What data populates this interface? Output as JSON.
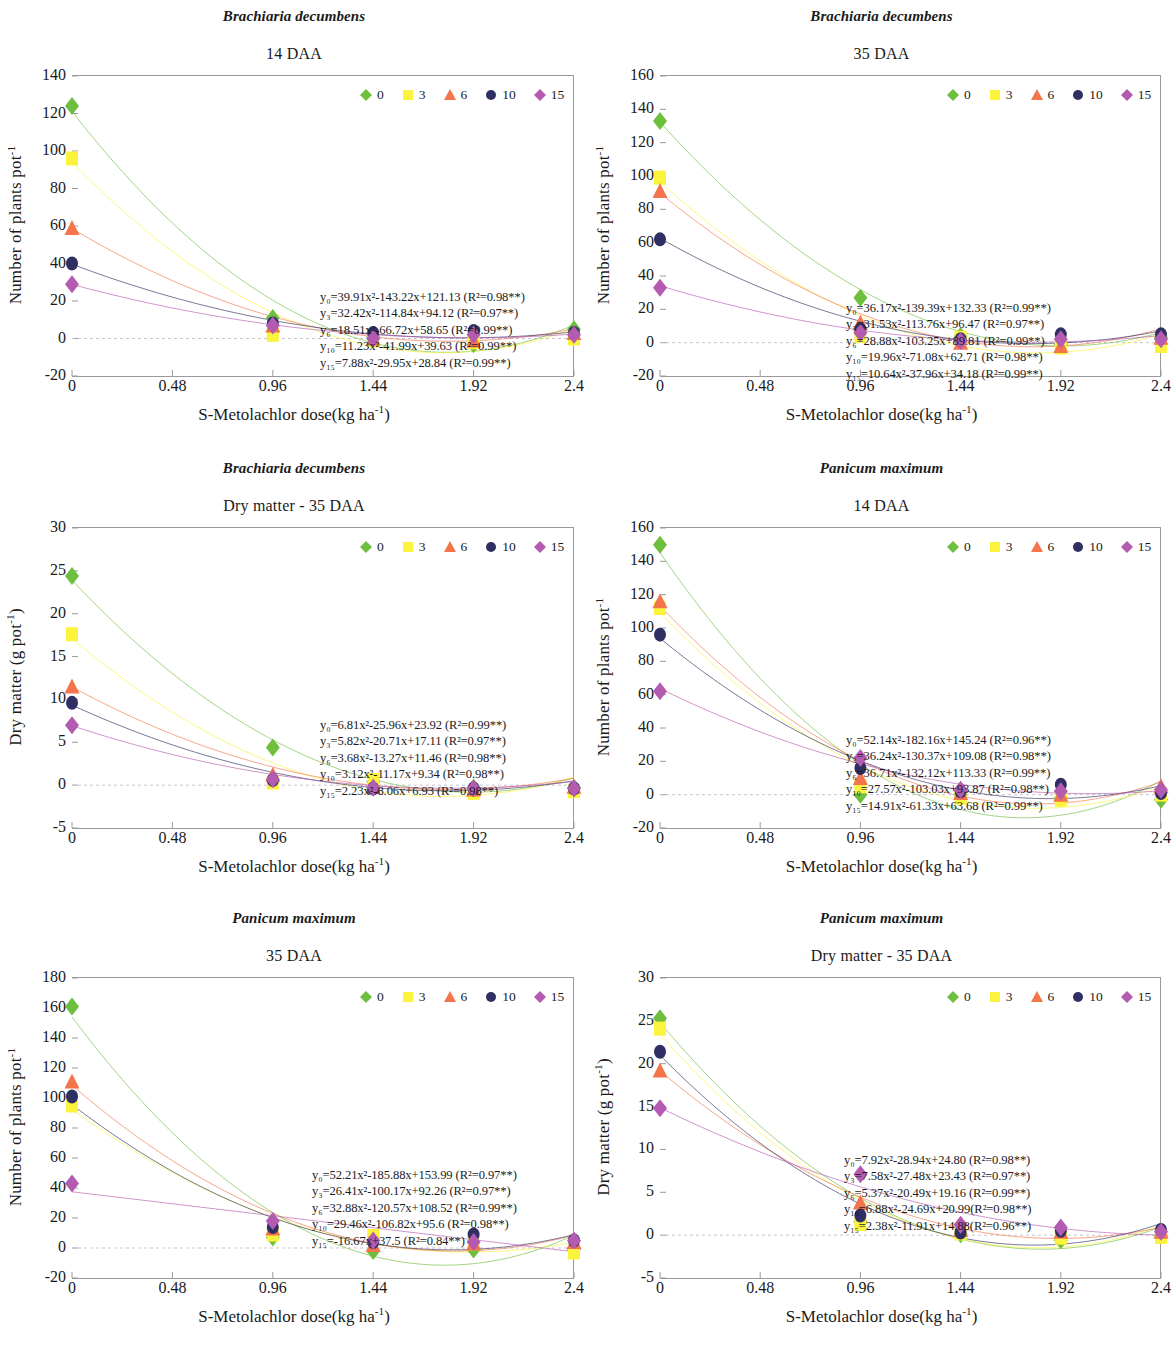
{
  "axis": {
    "xlabel_main": "S-Metolachlor dose(kg ha",
    "xlabel_sup": "-1",
    "xlabel_close": ")",
    "ylabel_plants_main": "Number of plants pot",
    "ylabel_plants_sup": "-1",
    "ylabel_dm_main": "Dry matter (g pot",
    "ylabel_dm_sup": "-1",
    "ylabel_dm_close": ")",
    "xticks": [
      "0",
      "0.48",
      "0.96",
      "1.44",
      "1.92",
      "2.4"
    ]
  },
  "legend": {
    "items": [
      {
        "label": "0",
        "marker": "diamond",
        "color": "#6fbf3f",
        "name": "legend-marker-0"
      },
      {
        "label": "3",
        "marker": "square",
        "color": "#fbf33c",
        "name": "legend-marker-3"
      },
      {
        "label": "6",
        "marker": "triangle",
        "color": "#f4744b",
        "name": "legend-marker-6"
      },
      {
        "label": "10",
        "marker": "circle",
        "color": "#2f2f63",
        "name": "legend-marker-10"
      },
      {
        "label": "15",
        "marker": "diamond",
        "color": "#b35bb0",
        "name": "legend-marker-15"
      }
    ]
  },
  "charts": [
    {
      "id": "bd-14daa",
      "species": "Brachiaria decumbens",
      "subtitle": "14 DAA",
      "equations": [
        "y₀=39.91x²-143.22x+121.13 (R²=0.98**)",
        "y₃=32.42x²-114.84x+94.12 (R²=0.97**)",
        "y₆=18.51x²-66.72x+58.65 (R²=0.99**)",
        "y₁₀=11.23x²-41.99x+39.63 (R²=0.99**)",
        "y₁₅=7.88x²-29.95x+28.84 (R²=0.99**)"
      ],
      "chart_data": {
        "type": "scatter",
        "title": "Brachiaria decumbens — 14 DAA",
        "xlabel": "S-Metolachlor dose(kg ha-1)",
        "ylabel": "Number of plants pot-1",
        "xlim": [
          0,
          2.4
        ],
        "ylim": [
          -20,
          140
        ],
        "yticks": [
          -20,
          0,
          20,
          40,
          60,
          80,
          100,
          120,
          140
        ],
        "x": [
          0,
          0.96,
          1.44,
          1.92,
          2.4
        ],
        "series": [
          {
            "name": "0",
            "coef": [
              39.91,
              -143.22,
              121.13
            ],
            "r2": "0.98**",
            "values": [
              124,
              11,
              1,
              -3,
              5
            ]
          },
          {
            "name": "3",
            "coef": [
              32.42,
              -114.84,
              94.12
            ],
            "r2": "0.97**",
            "values": [
              96,
              2,
              -1,
              -2,
              0
            ]
          },
          {
            "name": "6",
            "coef": [
              18.51,
              -66.72,
              58.65
            ],
            "r2": "0.99**",
            "values": [
              59,
              7,
              0,
              -1,
              3
            ]
          },
          {
            "name": "10",
            "coef": [
              11.23,
              -41.99,
              39.63
            ],
            "r2": "0.99**",
            "values": [
              40,
              8,
              3,
              4,
              3
            ]
          },
          {
            "name": "15",
            "coef": [
              7.88,
              -29.95,
              28.84
            ],
            "r2": "0.99**",
            "values": [
              29,
              7,
              0,
              2,
              2
            ]
          }
        ]
      }
    },
    {
      "id": "bd-35daa",
      "species": "Brachiaria decumbens",
      "subtitle": "35 DAA",
      "equations": [
        "y₀=36.17x²-139.39x+132.33 (R²=0.99**)",
        "y₃=31.53x²-113.76x+96.47 (R²=0.97**)",
        "y₆=28.88x²-103.25x+89.81 (R²=0.99**)",
        "y₁₀=19.96x²-71.08x+62.71 (R²=0.98**)",
        "y₁₅=10.64x²-37.96x+34.18 (R²=0.99**)"
      ],
      "chart_data": {
        "type": "scatter",
        "title": "Brachiaria decumbens — 35 DAA",
        "xlabel": "S-Metolachlor dose(kg ha-1)",
        "ylabel": "Number of plants pot-1",
        "xlim": [
          0,
          2.4
        ],
        "ylim": [
          -20,
          160
        ],
        "yticks": [
          -20,
          0,
          20,
          40,
          60,
          80,
          100,
          120,
          140,
          160
        ],
        "x": [
          0,
          0.96,
          1.44,
          1.92,
          2.4
        ],
        "series": [
          {
            "name": "0",
            "coef": [
              36.17,
              -139.39,
              132.33
            ],
            "r2": "0.99**",
            "values": [
              133,
              27,
              4,
              -1,
              3
            ]
          },
          {
            "name": "3",
            "coef": [
              31.53,
              -113.76,
              96.47
            ],
            "r2": "0.97**",
            "values": [
              99,
              4,
              3,
              -3,
              -2
            ]
          },
          {
            "name": "6",
            "coef": [
              28.88,
              -103.25,
              89.81
            ],
            "r2": "0.99**",
            "values": [
              91,
              12,
              0,
              -2,
              3
            ]
          },
          {
            "name": "10",
            "coef": [
              19.96,
              -71.08,
              62.71
            ],
            "r2": "0.98**",
            "values": [
              62,
              8,
              2,
              5,
              5
            ]
          },
          {
            "name": "15",
            "coef": [
              10.64,
              -37.96,
              34.18
            ],
            "r2": "0.99**",
            "values": [
              33,
              6,
              1,
              2,
              2
            ]
          }
        ]
      }
    },
    {
      "id": "bd-dm-35daa",
      "species": "Brachiaria decumbens",
      "subtitle": "Dry matter - 35 DAA",
      "equations": [
        "y₀=6.81x²-25.96x+23.92 (R²=0.99**)",
        "y₃=5.82x²-20.71x+17.11 (R²=0.97**)",
        "y₆=3.68x²-13.27x+11.46 (R²=0.98**)",
        "y₁₀=3.12x²-11.17x+9.34 (R²=0.98**)",
        "y₁₅=2.23x²-8.06x+6.93 (R²=0.98**)"
      ],
      "chart_data": {
        "type": "scatter",
        "title": "Brachiaria decumbens — Dry matter - 35 DAA",
        "xlabel": "S-Metolachlor dose(kg ha-1)",
        "ylabel": "Dry matter (g pot-1)",
        "xlim": [
          0,
          2.4
        ],
        "ylim": [
          -5,
          30
        ],
        "yticks": [
          -5,
          0,
          5,
          10,
          15,
          20,
          25,
          30
        ],
        "x": [
          0,
          0.96,
          1.44,
          1.92,
          2.4
        ],
        "series": [
          {
            "name": "0",
            "coef": [
              6.81,
              -25.96,
              23.92
            ],
            "r2": "0.99**",
            "values": [
              24.4,
              4.4,
              0.4,
              -0.3,
              -0.3
            ]
          },
          {
            "name": "3",
            "coef": [
              5.82,
              -20.71,
              17.11
            ],
            "r2": "0.97**",
            "values": [
              17.6,
              0.3,
              0.6,
              -0.9,
              -0.7
            ]
          },
          {
            "name": "6",
            "coef": [
              3.68,
              -13.27,
              11.46
            ],
            "r2": "0.98**",
            "values": [
              11.5,
              1.2,
              -0.2,
              -0.5,
              -0.2
            ]
          },
          {
            "name": "10",
            "coef": [
              3.12,
              -11.17,
              9.34
            ],
            "r2": "0.98**",
            "values": [
              9.6,
              0.6,
              -0.4,
              -0.4,
              -0.4
            ]
          },
          {
            "name": "15",
            "coef": [
              2.23,
              -8.06,
              6.93
            ],
            "r2": "0.98**",
            "values": [
              7.0,
              0.7,
              -0.3,
              -0.4,
              -0.4
            ]
          }
        ]
      }
    },
    {
      "id": "pm-14daa",
      "species": "Panicum maximum",
      "subtitle": "14 DAA",
      "equations": [
        "y₀=52.14x²-182.16x+145.24 (R²=0.96**)",
        "y₃=36.24x²-130.37x+109.08 (R²=0.98**)",
        "y₆=36.71x²-132.12x+113.33 (R²=0.99**)",
        "y₁₀=27.57x²-103.03x+93.87 (R²=0.98**)",
        "y₁₅=14.91x²-61.33x+63.68 (R²=0.99**)"
      ],
      "chart_data": {
        "type": "scatter",
        "title": "Panicum maximum — 14 DAA",
        "xlabel": "S-Metolachlor dose(kg ha-1)",
        "ylabel": "Number of plants pot-1",
        "xlim": [
          0,
          2.4
        ],
        "ylim": [
          -20,
          160
        ],
        "yticks": [
          -20,
          0,
          20,
          40,
          60,
          80,
          100,
          120,
          140,
          160
        ],
        "x": [
          0,
          0.96,
          1.44,
          1.92,
          2.4
        ],
        "series": [
          {
            "name": "0",
            "coef": [
              52.14,
              -182.16,
              145.24
            ],
            "r2": "0.96**",
            "values": [
              150,
              0,
              0,
              -2,
              -3
            ]
          },
          {
            "name": "3",
            "coef": [
              36.24,
              -130.37,
              109.08
            ],
            "r2": "0.98**",
            "values": [
              112,
              5,
              -2,
              -3,
              0
            ]
          },
          {
            "name": "6",
            "coef": [
              36.71,
              -132.12,
              113.33
            ],
            "r2": "0.99**",
            "values": [
              116,
              10,
              1,
              0,
              5
            ]
          },
          {
            "name": "10",
            "coef": [
              27.57,
              -103.03,
              93.87
            ],
            "r2": "0.98**",
            "values": [
              96,
              16,
              2,
              6,
              1
            ]
          },
          {
            "name": "15",
            "coef": [
              14.91,
              -61.33,
              63.68
            ],
            "r2": "0.99**",
            "values": [
              62,
              22,
              3,
              2,
              3
            ]
          }
        ]
      }
    },
    {
      "id": "pm-35daa",
      "species": "Panicum maximum",
      "subtitle": "35 DAA",
      "equations": [
        "y₀=52.21x²-185.88x+153.99 (R²=0.97**)",
        "y₃=26.41x²-100.17x+92.26 (R²=0.97**)",
        "y₆=32.88x²-120.57x+108.52 (R²=0.99**)",
        "y₁₀=29.46x²-106.82x+95.6 (R²=0.98**)",
        "y₁₅=-16.67x+37.5 (R²=0.84**)"
      ],
      "chart_data": {
        "type": "scatter",
        "title": "Panicum maximum — 35 DAA",
        "xlabel": "S-Metolachlor dose(kg ha-1)",
        "ylabel": "Number of plants pot-1",
        "xlim": [
          0,
          2.4
        ],
        "ylim": [
          -20,
          180
        ],
        "yticks": [
          -20,
          0,
          20,
          40,
          60,
          80,
          100,
          120,
          140,
          160,
          180
        ],
        "x": [
          0,
          0.96,
          1.44,
          1.92,
          2.4
        ],
        "series": [
          {
            "name": "0",
            "coef": [
              52.21,
              -185.88,
              153.99
            ],
            "r2": "0.97**",
            "values": [
              161,
              7,
              -2,
              -1,
              -1
            ]
          },
          {
            "name": "3",
            "coef": [
              26.41,
              -100.17,
              92.26
            ],
            "r2": "0.97**",
            "values": [
              95,
              9,
              8,
              3,
              -3
            ]
          },
          {
            "name": "6",
            "coef": [
              32.88,
              -120.57,
              108.52
            ],
            "r2": "0.99**",
            "values": [
              111,
              13,
              2,
              3,
              4
            ]
          },
          {
            "name": "10",
            "coef": [
              29.46,
              -106.82,
              95.6
            ],
            "r2": "0.98**",
            "values": [
              101,
              14,
              4,
              9,
              5
            ]
          },
          {
            "name": "15",
            "coef": [
              -16.67,
              37.5
            ],
            "r2": "0.84**",
            "values": [
              43,
              18,
              5,
              4,
              5
            ]
          }
        ]
      }
    },
    {
      "id": "pm-dm-35daa",
      "species": "Panicum maximum",
      "subtitle": "Dry matter - 35 DAA",
      "equations": [
        "y₀=7.92x²-28.94x+24.80 (R²=0.98**)",
        "y₃=7.58x²-27.48x+23.43 (R²=0.97**)",
        "y₆=5.37x²-20.49x+19.16 (R²=0.99**)",
        "y₁₀=6.88x²-24.69x+20.99(R²=0.98**)",
        "y₁₅=2.38x²-11.91x+14.88(R²=0.96**)"
      ],
      "chart_data": {
        "type": "scatter",
        "title": "Panicum maximum — Dry matter - 35 DAA",
        "xlabel": "S-Metolachlor dose(kg ha-1)",
        "ylabel": "Dry matter (g pot-1)",
        "xlim": [
          0,
          2.4
        ],
        "ylim": [
          -5,
          30
        ],
        "yticks": [
          -5,
          0,
          5,
          10,
          15,
          20,
          25,
          30
        ],
        "x": [
          0,
          0.96,
          1.44,
          1.92,
          2.4
        ],
        "series": [
          {
            "name": "0",
            "coef": [
              7.92,
              -28.94,
              24.8
            ],
            "r2": "0.98**",
            "values": [
              25.3,
              1.6,
              0.1,
              -0.6,
              0.0
            ]
          },
          {
            "name": "3",
            "coef": [
              7.58,
              -27.48,
              23.43
            ],
            "r2": "0.97**",
            "values": [
              24.1,
              1.3,
              0.2,
              -0.3,
              -0.2
            ]
          },
          {
            "name": "6",
            "coef": [
              5.37,
              -20.49,
              19.16
            ],
            "r2": "0.99**",
            "values": [
              19.2,
              3.8,
              0.6,
              0.4,
              0.4
            ]
          },
          {
            "name": "10",
            "coef": [
              6.88,
              -24.69,
              20.99
            ],
            "r2": "0.98**",
            "values": [
              21.4,
              2.3,
              0.3,
              0.5,
              0.6
            ]
          },
          {
            "name": "15",
            "coef": [
              2.38,
              -11.91,
              14.88
            ],
            "r2": "0.96**",
            "values": [
              14.8,
              7.1,
              1.2,
              0.9,
              0.4
            ]
          }
        ]
      }
    }
  ]
}
